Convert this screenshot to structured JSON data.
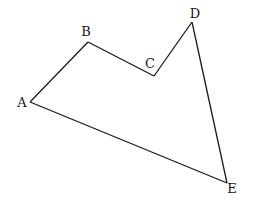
{
  "diagram": {
    "type": "polygon",
    "name": "pentagon ABCDE",
    "stroke_color": "#1a1a1a",
    "background": "#ffffff",
    "vertices": [
      {
        "label": "A",
        "x": 30,
        "y": 102,
        "label_x": 22,
        "label_y": 102
      },
      {
        "label": "B",
        "x": 88,
        "y": 42,
        "label_x": 86,
        "label_y": 31
      },
      {
        "label": "C",
        "x": 154,
        "y": 76,
        "label_x": 150,
        "label_y": 63
      },
      {
        "label": "D",
        "x": 192,
        "y": 22,
        "label_x": 195,
        "label_y": 13
      },
      {
        "label": "E",
        "x": 227,
        "y": 183,
        "label_x": 232,
        "label_y": 188
      }
    ],
    "edges": [
      {
        "from": "A",
        "to": "B"
      },
      {
        "from": "B",
        "to": "C"
      },
      {
        "from": "C",
        "to": "D"
      },
      {
        "from": "D",
        "to": "E"
      },
      {
        "from": "E",
        "to": "A"
      }
    ]
  }
}
